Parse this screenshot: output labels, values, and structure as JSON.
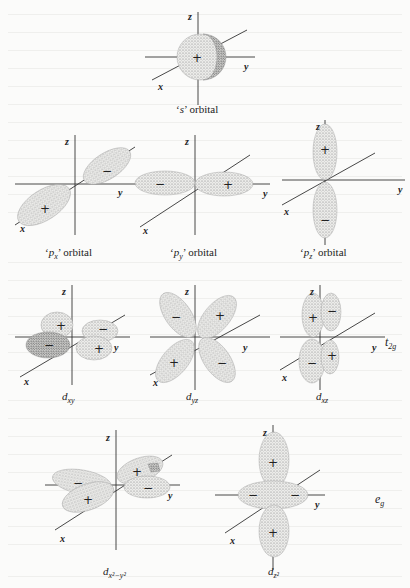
{
  "figure": {
    "axes_labels": {
      "x": "x",
      "y": "y",
      "z": "z"
    },
    "signs": {
      "plus": "+",
      "minus": "−"
    },
    "orbitals": [
      {
        "id": "s",
        "caption_prefix": "‘",
        "caption_symbol": "s",
        "caption_sub": "",
        "caption_suffix": "’ orbital",
        "lobes": [
          "+"
        ]
      },
      {
        "id": "px",
        "caption_prefix": "‘",
        "caption_symbol": "p",
        "caption_sub": "x",
        "caption_suffix": "’ orbital",
        "lobes": [
          "+",
          "−"
        ]
      },
      {
        "id": "py",
        "caption_prefix": "‘",
        "caption_symbol": "p",
        "caption_sub": "y",
        "caption_suffix": "’ orbital",
        "lobes": [
          "−",
          "+"
        ]
      },
      {
        "id": "pz",
        "caption_prefix": "‘",
        "caption_symbol": "p",
        "caption_sub": "z",
        "caption_suffix": "’ orbital",
        "lobes": [
          "+",
          "−"
        ]
      },
      {
        "id": "dxy",
        "caption_symbol": "d",
        "caption_sub": "xy",
        "lobes": [
          "+",
          "−",
          "−",
          "+"
        ]
      },
      {
        "id": "dyz",
        "caption_symbol": "d",
        "caption_sub": "yz",
        "lobes": [
          "−",
          "+",
          "+",
          "−"
        ]
      },
      {
        "id": "dxz",
        "caption_symbol": "d",
        "caption_sub": "xz",
        "lobes": [
          "+",
          "−",
          "−",
          "+"
        ]
      },
      {
        "id": "dx2y2",
        "caption_symbol": "d",
        "caption_sub": "x²−y²",
        "lobes": [
          "+",
          "−",
          "+",
          "−"
        ]
      },
      {
        "id": "dz2",
        "caption_symbol": "d",
        "caption_sub": "z²",
        "lobes": [
          "+",
          "+",
          "−"
        ]
      }
    ],
    "groups": {
      "t2g": {
        "symbol": "t",
        "sub": "2g"
      },
      "eg": {
        "symbol": "e",
        "sub": "g"
      }
    }
  }
}
